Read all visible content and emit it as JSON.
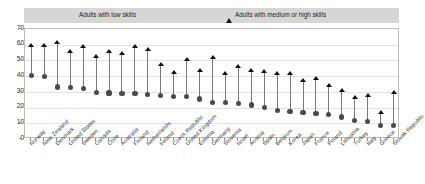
{
  "chart_data": {
    "type": "scatter",
    "title": "",
    "subtitle": "",
    "xlabel": "",
    "ylabel": "",
    "ylim": [
      0,
      70
    ],
    "yticks": [
      0,
      10,
      20,
      30,
      40,
      50,
      60,
      70
    ],
    "grid": true,
    "legend_position": "top",
    "legend": [
      {
        "label": "Adults with low skills",
        "marker": "circle",
        "color": "#555555"
      },
      {
        "label": "Adults with medium or high skills",
        "marker": "triangle",
        "color": "#1a1a1a"
      }
    ],
    "categories": [
      "Norway",
      "New Zealand",
      "Denmark",
      "United States",
      "Sweden",
      "Canada",
      "Chile",
      "Australia",
      "Finland",
      "Netherlands",
      "Ireland",
      "Czech Republic",
      "United Kingdom",
      "Estonia",
      "Germany",
      "Slovenia",
      "Israel",
      "Austria",
      "Spain",
      "Belgium",
      "Korea",
      "Japan",
      "France",
      "Poland",
      "Lithuania",
      "Turkey",
      "Italy",
      "Greece",
      "Slovak Republic"
    ],
    "series": [
      {
        "name": "Adults with low skills",
        "marker": "circle",
        "values": [
          40.3,
          39.8,
          33.1,
          32.7,
          32.2,
          29.4,
          29.3,
          29.0,
          29.0,
          28.4,
          27.5,
          27.3,
          26.9,
          25.4,
          23.4,
          23.3,
          22.6,
          21.6,
          19.9,
          17.9,
          17.6,
          17.1,
          16.1,
          15.8,
          14.0,
          11.9,
          11.3,
          8.6,
          8.6
        ]
      },
      {
        "name": "Adults with medium or high skills",
        "marker": "triangle",
        "values": [
          59.8,
          59.7,
          61.8,
          56.0,
          59.3,
          52.7,
          56.0,
          54.5,
          59.3,
          56.8,
          47.8,
          42.5,
          50.5,
          43.8,
          52.0,
          41.7,
          46.5,
          44.0,
          43.4,
          41.8,
          41.9,
          37.6,
          38.4,
          34.3,
          30.8,
          26.8,
          27.5,
          16.9,
          29.8
        ]
      }
    ]
  }
}
